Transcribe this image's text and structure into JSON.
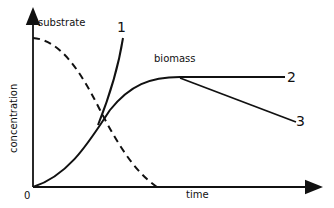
{
  "diagram": {
    "y_axis_label": "concentration",
    "x_axis_label": "time",
    "origin_label": "0",
    "curve_labels": {
      "substrate": "substrate",
      "biomass": "biomass",
      "one": "1",
      "two": "2",
      "three": "3"
    },
    "colors": {
      "ink": "#111111",
      "background": "#ffffff"
    }
  }
}
